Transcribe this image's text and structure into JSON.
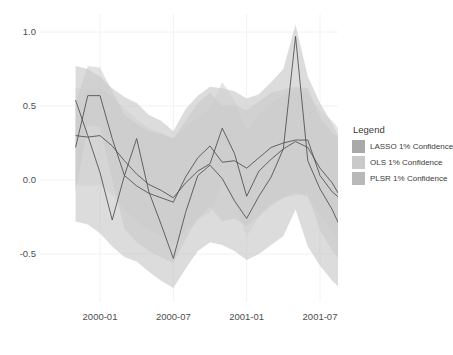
{
  "chart_data": {
    "type": "line",
    "title": "",
    "xlabel": "",
    "ylabel": "",
    "xlim": [
      "1999-11",
      "2001-09"
    ],
    "ylim": [
      -0.75,
      1.05
    ],
    "grid": true,
    "grid_color": "#f2f2f2",
    "y_ticks": [
      "1.0",
      "0.5",
      "0.0",
      "-0.5"
    ],
    "y_tick_values": [
      1.0,
      0.5,
      0.0,
      -0.5
    ],
    "x_ticks": [
      "2000-01",
      "2000-07",
      "2001-01",
      "2001-07"
    ],
    "x_tick_values": [
      "2000-01",
      "2000-07",
      "2001-01",
      "2001-07"
    ],
    "x": [
      "1999-11",
      "1999-12",
      "2000-01",
      "2000-02",
      "2000-03",
      "2000-04",
      "2000-05",
      "2000-06",
      "2000-07",
      "2000-08",
      "2000-09",
      "2000-10",
      "2000-11",
      "2000-12",
      "2001-01",
      "2001-02",
      "2001-03",
      "2001-04",
      "2001-05",
      "2001-06",
      "2001-07",
      "2001-08",
      "2001-09"
    ],
    "series": [
      {
        "name": "LASSO",
        "color": "#4a4a4a",
        "values": [
          0.54,
          0.3,
          0.05,
          -0.27,
          0.03,
          0.28,
          -0.08,
          -0.3,
          -0.53,
          -0.22,
          0.03,
          0.1,
          0.01,
          -0.14,
          -0.26,
          -0.11,
          0.02,
          0.21,
          0.97,
          0.13,
          -0.06,
          -0.2,
          -0.38
        ],
        "ribbon_name": "LASSO 1% Confidence",
        "ribbon_color": "#bfbfbf",
        "ribbon_upper": [
          0.77,
          0.75,
          0.7,
          0.62,
          0.56,
          0.52,
          0.44,
          0.4,
          0.33,
          0.48,
          0.57,
          0.63,
          0.62,
          0.6,
          0.55,
          0.58,
          0.66,
          0.75,
          1.05,
          0.7,
          0.52,
          0.38,
          0.22
        ],
        "ribbon_lower": [
          -0.28,
          -0.3,
          -0.36,
          -0.45,
          -0.52,
          -0.55,
          -0.62,
          -0.68,
          -0.73,
          -0.6,
          -0.48,
          -0.42,
          -0.44,
          -0.48,
          -0.54,
          -0.5,
          -0.44,
          -0.38,
          -0.2,
          -0.45,
          -0.58,
          -0.68,
          -0.76
        ]
      },
      {
        "name": "OLS",
        "color": "#4a4a4a",
        "values": [
          0.3,
          0.29,
          0.3,
          0.23,
          0.13,
          0.04,
          -0.03,
          -0.07,
          -0.12,
          -0.02,
          0.06,
          0.11,
          0.35,
          0.18,
          -0.11,
          0.06,
          0.14,
          0.21,
          0.26,
          0.22,
          0.08,
          -0.02,
          -0.16
        ],
        "ribbon_name": "OLS 1% Confidence",
        "ribbon_color": "#d0d0d0",
        "ribbon_upper": [
          0.62,
          0.61,
          0.62,
          0.56,
          0.48,
          0.41,
          0.35,
          0.32,
          0.28,
          0.36,
          0.43,
          0.48,
          0.66,
          0.54,
          0.33,
          0.45,
          0.51,
          0.57,
          0.61,
          0.58,
          0.47,
          0.4,
          0.3
        ],
        "ribbon_lower": [
          -0.03,
          -0.04,
          -0.03,
          -0.1,
          -0.2,
          -0.28,
          -0.34,
          -0.38,
          -0.43,
          -0.34,
          -0.27,
          -0.22,
          -0.01,
          -0.16,
          -0.38,
          -0.25,
          -0.18,
          -0.12,
          -0.08,
          -0.12,
          -0.24,
          -0.34,
          -0.48
        ]
      },
      {
        "name": "PLSR",
        "color": "#4a4a4a",
        "values": [
          0.22,
          0.57,
          0.57,
          0.28,
          0.03,
          -0.04,
          -0.09,
          -0.12,
          -0.15,
          0.02,
          0.15,
          0.23,
          0.12,
          0.13,
          0.08,
          0.15,
          0.22,
          0.25,
          0.27,
          0.27,
          0.03,
          -0.08,
          -0.15
        ],
        "ribbon_name": "PLSR 1% Confidence",
        "ribbon_color": "#c8c8c8",
        "ribbon_upper": [
          0.52,
          0.77,
          0.76,
          0.6,
          0.44,
          0.38,
          0.33,
          0.31,
          0.28,
          0.4,
          0.52,
          0.59,
          0.5,
          0.51,
          0.47,
          0.53,
          0.59,
          0.61,
          0.63,
          0.62,
          0.42,
          0.32,
          0.25
        ],
        "ribbon_lower": [
          -0.08,
          0.37,
          0.36,
          0.0,
          -0.33,
          -0.42,
          -0.48,
          -0.52,
          -0.56,
          -0.4,
          -0.26,
          -0.18,
          -0.28,
          -0.26,
          -0.31,
          -0.24,
          -0.16,
          -0.12,
          -0.1,
          -0.1,
          -0.34,
          -0.48,
          -0.58
        ]
      }
    ]
  },
  "legend": {
    "title": "Legend",
    "items": [
      {
        "label": "LASSO 1% Confidence",
        "color": "#a9a9a9"
      },
      {
        "label": "OLS 1% Confidence",
        "color": "#c9c9c9"
      },
      {
        "label": "PLSR 1% Confidence",
        "color": "#b9b9b9"
      }
    ]
  }
}
